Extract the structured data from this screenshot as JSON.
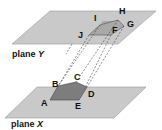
{
  "planes": {
    "top": {
      "name": "plane",
      "letter": "Y",
      "color": "#c8c8c8"
    },
    "bottom": {
      "name": "plane",
      "letter": "X",
      "color": "#c8c8c8"
    }
  },
  "top_polygon": {
    "vertices": [
      "F",
      "G",
      "H",
      "I",
      "J"
    ],
    "fill": "#a9a9a9"
  },
  "bottom_polygon": {
    "vertices": [
      "A",
      "B",
      "C",
      "D",
      "E"
    ],
    "fill": "#7d7d7d"
  },
  "labels": {
    "F": "F",
    "G": "G",
    "H": "H",
    "I": "I",
    "J": "J",
    "A": "A",
    "B": "B",
    "C": "C",
    "D": "D",
    "E": "E"
  },
  "plane_y_label": "plane",
  "plane_y_letter": "Y",
  "plane_x_label": "plane",
  "plane_x_letter": "X"
}
